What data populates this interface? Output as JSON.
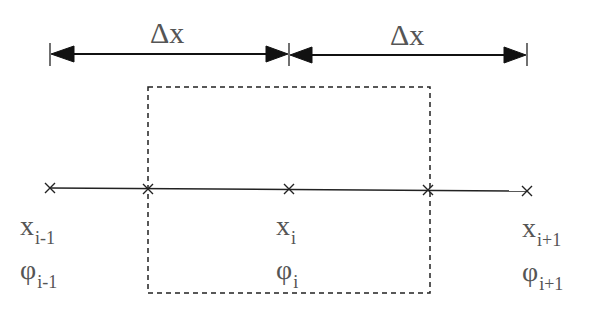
{
  "diagram": {
    "spacing_labels": [
      "Δx",
      "Δx"
    ],
    "nodes": [
      {
        "x_label": "x",
        "x_sub": "i-1",
        "phi_label": "φ",
        "phi_sub": "i-1"
      },
      {
        "x_label": "x",
        "x_sub": "i",
        "phi_label": "φ",
        "phi_sub": "i"
      },
      {
        "x_label": "x",
        "x_sub": "i+1",
        "phi_label": "φ",
        "phi_sub": "i+1"
      }
    ],
    "control_volume": "dashed box around node i"
  }
}
